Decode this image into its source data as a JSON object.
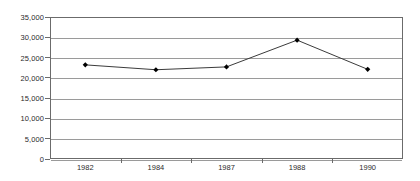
{
  "chart_data": {
    "type": "line",
    "title": "",
    "subtitle": "",
    "xlabel": "",
    "ylabel": "",
    "categories": [
      "1982",
      "1984",
      "1987",
      "1988",
      "1990"
    ],
    "series": [
      {
        "name": "",
        "values": [
          23200,
          22000,
          22700,
          29300,
          22100
        ]
      }
    ],
    "ylim": [
      0,
      35000
    ],
    "yticks": [
      0,
      5000,
      10000,
      15000,
      20000,
      25000,
      30000,
      35000
    ],
    "ytick_labels": [
      "0",
      "5,000",
      "10,000",
      "15,000",
      "20,000",
      "25,000",
      "30,000",
      "35,000"
    ],
    "grid": true,
    "grid_axis": "y",
    "legend": false,
    "legend_position": "none",
    "marker": "diamond",
    "colors": {
      "line": "#3b3b3b",
      "marker": "#000000",
      "gridline": "#9a9a9a",
      "axis": "#6b6b6b",
      "text": "#2b2b2b",
      "plot_background": "#ffffff",
      "page_background": "#ffffff"
    }
  }
}
